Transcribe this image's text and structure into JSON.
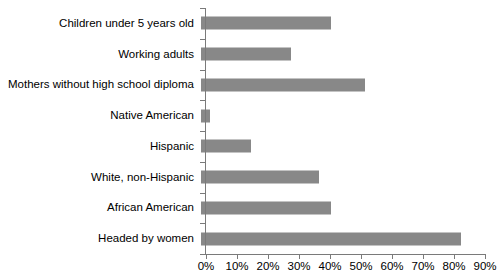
{
  "chart_data": {
    "type": "bar",
    "orientation": "horizontal",
    "title": "",
    "subtitle": "",
    "xlabel": "",
    "ylabel": "",
    "xlim": [
      0,
      90
    ],
    "xtick_step": 10,
    "grid": false,
    "legend": null,
    "bar_color": "#888888",
    "axis_color": "#7a7a7a",
    "text_color": "#000000",
    "categories": [
      "Children under 5 years old",
      "Working adults",
      "Mothers without high school diploma",
      "Native American",
      "Hispanic",
      "White, non-Hispanic",
      "African American",
      "Headed by women"
    ],
    "values": [
      42,
      29,
      53,
      3,
      16,
      38,
      42,
      84
    ],
    "value_suffix": "%",
    "xticks": [
      {
        "value": 0,
        "label": "0%"
      },
      {
        "value": 10,
        "label": "10%"
      },
      {
        "value": 20,
        "label": "20%"
      },
      {
        "value": 30,
        "label": "30%"
      },
      {
        "value": 40,
        "label": "40%"
      },
      {
        "value": 50,
        "label": "50%"
      },
      {
        "value": 60,
        "label": "60%"
      },
      {
        "value": 70,
        "label": "70%"
      },
      {
        "value": 80,
        "label": "80%"
      },
      {
        "value": 90,
        "label": "90%"
      }
    ]
  }
}
